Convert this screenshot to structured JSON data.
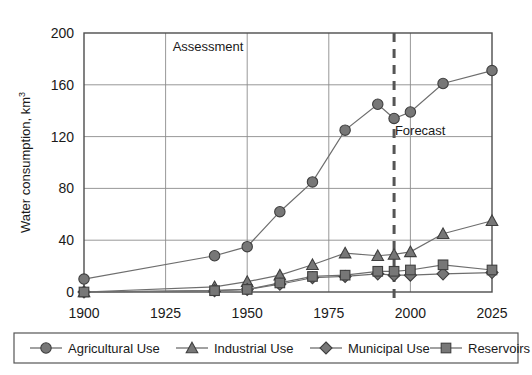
{
  "chart_data": {
    "type": "line",
    "title": "",
    "xlabel": "",
    "ylabel": "Water consumption, km",
    "ylabel_sup": "3",
    "xlim": [
      1900,
      2025
    ],
    "ylim": [
      0,
      200
    ],
    "ytick_values": [
      0,
      40,
      80,
      120,
      160,
      200
    ],
    "ytick_labels": [
      "0",
      "40",
      "80",
      "120",
      "160",
      "200"
    ],
    "xtick_values": [
      1900,
      1925,
      1950,
      1975,
      2000,
      2025
    ],
    "xtick_labels": [
      "1900",
      "1925",
      "1950",
      "1975",
      "2000",
      "2025"
    ],
    "grid": true,
    "legend_position": "bottom",
    "annotations": [
      {
        "text": "Assessment",
        "x": 1938,
        "y": 186
      },
      {
        "text": "Forecast",
        "x": 2003,
        "y": 121
      }
    ],
    "divider_line": {
      "x": 1995,
      "style": "dashed"
    },
    "x": [
      1900,
      1940,
      1950,
      1960,
      1970,
      1980,
      1990,
      1995,
      2000,
      2010,
      2025
    ],
    "series": [
      {
        "name": "Agricultural Use",
        "marker": "circle",
        "color": "#777777",
        "values": [
          10,
          28,
          35,
          62,
          85,
          125,
          145,
          134,
          139,
          161,
          171
        ]
      },
      {
        "name": "Industrial Use",
        "marker": "triangle",
        "color": "#9a9a9a",
        "values": [
          0,
          4,
          8,
          13,
          21,
          30,
          28,
          29,
          31,
          45,
          55
        ]
      },
      {
        "name": "Municipal Use",
        "marker": "diamond",
        "color": "#8a8a8a",
        "values": [
          0,
          1,
          2,
          6,
          11,
          12,
          14,
          13,
          13,
          14,
          15
        ]
      },
      {
        "name": "Reservoirs",
        "marker": "square",
        "color": "#6e6e6e",
        "values": [
          0,
          1,
          2,
          7,
          12,
          13,
          16,
          16,
          17,
          21,
          17
        ]
      }
    ]
  },
  "legend": {
    "items": [
      {
        "label": "Agricultural Use",
        "marker": "circle"
      },
      {
        "label": "Industrial Use",
        "marker": "triangle"
      },
      {
        "label": "Municipal Use",
        "marker": "diamond"
      },
      {
        "label": "Reservoirs",
        "marker": "square"
      }
    ]
  }
}
